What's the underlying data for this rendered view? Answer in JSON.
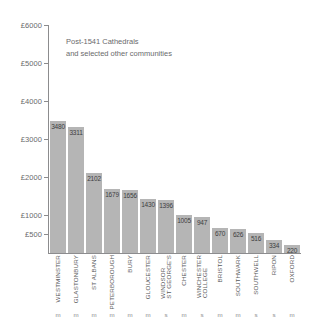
{
  "chart_data": {
    "type": "bar",
    "title": "Post-1541 Cathedrals and selected other communities",
    "title_lines": [
      "Post-1541 Cathedrals",
      "and selected other communities"
    ],
    "xlabel": "",
    "ylabel": "",
    "currency": "£",
    "ylim": [
      0,
      6000
    ],
    "grid": false,
    "legend": null,
    "ytick_labels": [
      "£6000",
      "£5000",
      "£4000",
      "£3000",
      "£2000",
      "£1000",
      "£500"
    ],
    "yticks": [
      6000,
      5000,
      4000,
      3000,
      2000,
      1000,
      500
    ],
    "categories": [
      "WESTMINSTER",
      "GLASTONBURY",
      "ST ALBANS",
      "PETERBOROUGH",
      "BURY",
      "GLOUCESTER",
      "WINDSOR ST GEORGE'S",
      "CHESTER",
      "WINCHESTER COLLEGE",
      "BRISTOL",
      "SOUTHWARK",
      "SOUTHWELL",
      "RIPON",
      "OXFORD"
    ],
    "category_lines": [
      [
        "WESTMINSTER"
      ],
      [
        "GLASTONBURY"
      ],
      [
        "ST ALBANS"
      ],
      [
        "PETERBOROUGH"
      ],
      [
        "BURY"
      ],
      [
        "GLOUCESTER"
      ],
      [
        "WINDSOR",
        "ST GEORGE'S"
      ],
      [
        "CHESTER"
      ],
      [
        "WINCHESTER",
        "COLLEGE"
      ],
      [
        "BRISTOL"
      ],
      [
        "SOUTHWARK"
      ],
      [
        "SOUTHWELL"
      ],
      [
        "RIPON"
      ],
      [
        "OXFORD"
      ]
    ],
    "values": [
      3480,
      3311,
      2102,
      1679,
      1656,
      1430,
      1396,
      1005,
      947,
      670,
      626,
      516,
      334,
      220
    ],
    "value_labels": [
      "3480",
      "3311",
      "2102",
      "1679",
      "1656",
      "1430",
      "1396",
      "1005",
      "947",
      "670",
      "626",
      "516",
      "334",
      "220"
    ],
    "house_type_markers": [
      "m",
      "m",
      "m",
      "m",
      "m",
      "m",
      "s",
      "m",
      "s",
      "m",
      "m",
      "s",
      "s",
      "m"
    ],
    "colors": {
      "bar_fill": "#b5b5b5",
      "bar_separator": "#ffffff",
      "axis": "#8c8c8e",
      "text": "#58585a",
      "value_text": "#3d3d3f",
      "background": "#ffffff"
    }
  }
}
